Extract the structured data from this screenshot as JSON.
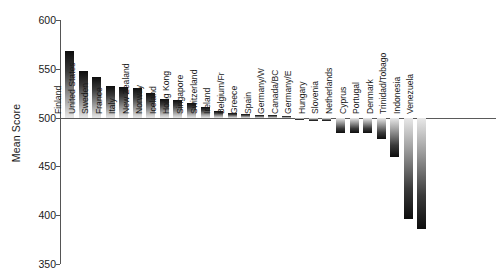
{
  "chart_data": {
    "type": "bar",
    "title": "",
    "xlabel": "",
    "ylabel": "Mean Score",
    "ylim": [
      350,
      600
    ],
    "yticks": [
      350,
      400,
      450,
      500,
      550,
      600
    ],
    "reference_line": 500,
    "grid": false,
    "legend": null,
    "categories": [
      "Finland",
      "United States",
      "Sweden",
      "France",
      "Italy",
      "New Zealand",
      "Norway",
      "Iceland",
      "Hong Kong",
      "Singapore",
      "Switzerland",
      "Ireland",
      "Belgium/Fr",
      "Greece",
      "Spain",
      "Germany/W",
      "Canada/BC",
      "Germany/E",
      "Hungary",
      "Slovenia",
      "Netherlands",
      "Cyprus",
      "Portugal",
      "Denmark",
      "Trinidad/Tobago",
      "Indonesia",
      "Venezuela"
    ],
    "values": [
      568,
      548,
      542,
      532,
      531,
      530,
      525,
      519,
      518,
      515,
      511,
      507,
      505,
      504,
      503,
      503,
      502,
      498,
      497,
      496,
      484,
      484,
      484,
      478,
      460,
      396,
      386
    ]
  },
  "axis": {
    "y_title": "Mean Score",
    "tick_labels": [
      "600",
      "550",
      "500",
      "450",
      "400",
      "350"
    ]
  }
}
